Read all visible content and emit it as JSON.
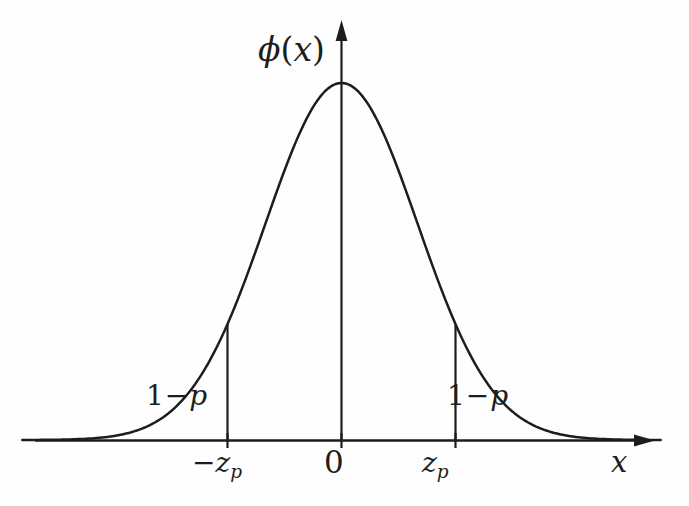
{
  "figure": {
    "kind": "normal-density-curve",
    "background_color": "#fefefe",
    "ink_color": "#1d1d1d"
  },
  "axes": {
    "y_axis_label": "ϕ(x)",
    "y_axis_label_parts": {
      "symbol": "ϕ",
      "open": "(",
      "variable": "x",
      "close": ")"
    },
    "x_axis_label": "x",
    "origin_label": "0",
    "ticks": [
      {
        "name": "negative-z-p",
        "base": "−z",
        "subscript": "p",
        "x_value": -1.5
      },
      {
        "name": "origin",
        "base": "0",
        "subscript": "",
        "x_value": 0
      },
      {
        "name": "positive-z-p",
        "base": "z",
        "subscript": "p",
        "x_value": 1.5
      }
    ]
  },
  "annotations": [
    {
      "name": "left-tail-area",
      "text": "1 − p",
      "lead": "1",
      "op": "−",
      "tail": "p",
      "side": "left"
    },
    {
      "name": "right-tail-area",
      "text": "1 − p",
      "lead": "1",
      "op": "−",
      "tail": "p",
      "side": "right"
    }
  ],
  "chart_data": {
    "type": "line",
    "title": "",
    "subtitle": "",
    "xlabel": "x",
    "ylabel": "ϕ(x)",
    "xlim": [
      -4.2,
      4.2
    ],
    "ylim": [
      0,
      0.43
    ],
    "grid": false,
    "legend": null,
    "curve_name": "standard normal density",
    "formula": "ϕ(x) = (1/√(2π)) e^(-x²/2)",
    "x": [
      -4.0,
      -3.6,
      -3.2,
      -2.8,
      -2.4,
      -2.0,
      -1.6,
      -1.5,
      -1.2,
      -0.8,
      -0.4,
      0.0,
      0.4,
      0.8,
      1.2,
      1.5,
      1.6,
      2.0,
      2.4,
      2.8,
      3.2,
      3.6,
      4.0
    ],
    "y": [
      0.0001,
      0.0006,
      0.0024,
      0.0079,
      0.0224,
      0.054,
      0.1109,
      0.1295,
      0.1942,
      0.2897,
      0.3683,
      0.3989,
      0.3683,
      0.2897,
      0.1942,
      0.1295,
      0.1109,
      0.054,
      0.0224,
      0.0079,
      0.0024,
      0.0006,
      0.0001
    ],
    "peak": {
      "x": 0,
      "y": 0.3989
    },
    "vertical_markers": [
      {
        "name": "left-boundary",
        "x": -1.5,
        "y_top": 0.1295,
        "label": "−z_p"
      },
      {
        "name": "right-boundary",
        "x": 1.5,
        "y_top": 0.1295,
        "label": "z_p"
      }
    ],
    "shaded_regions": [
      {
        "name": "left-tail",
        "from": -4.2,
        "to": -1.5,
        "label": "1 − p"
      },
      {
        "name": "right-tail",
        "from": 1.5,
        "to": 4.2,
        "label": "1 − p"
      }
    ]
  }
}
